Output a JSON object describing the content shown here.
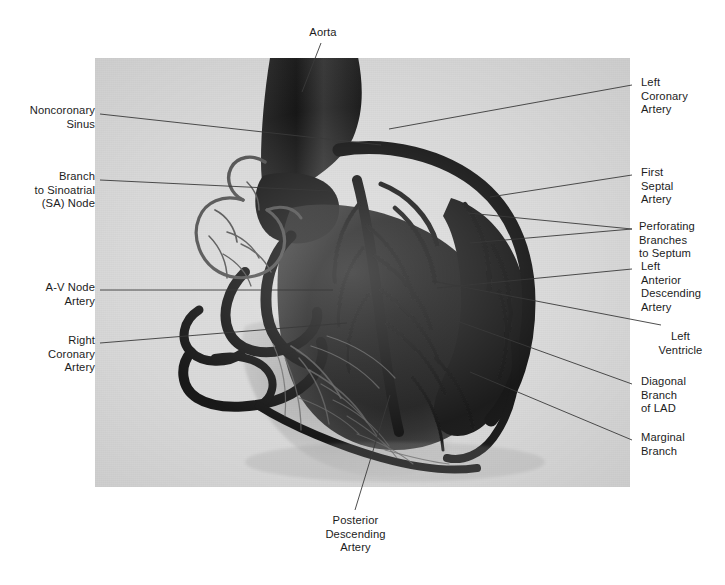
{
  "figure": {
    "kind": "coronary-arterial-cast-photograph",
    "plate": {
      "background_color": "#d8d8d8",
      "cast_color": "#141414",
      "left": 95,
      "top": 58,
      "width": 535,
      "height": 429
    },
    "page_background": "#ffffff",
    "leader_line_color": "#3a3a3a",
    "text_color": "#1c1c1c"
  },
  "labels": {
    "aorta": "Aorta",
    "noncoronary_sinus": "Noncoronary\nSinus",
    "sa_node_branch": "Branch\nto Sinoatrial\n(SA) Node",
    "av_node_artery": "A-V Node\nArtery",
    "right_coronary_artery": "Right\nCoronary\nArtery",
    "posterior_descending_artery": "Posterior\nDescending\nArtery",
    "left_coronary_artery": "Left\nCoronary\nArtery",
    "first_septal_artery": "First\nSeptal\nArtery",
    "perforating_branches": "Perforating\nBranches\nto Septum",
    "left_anterior_descending": "Left\nAnterior\nDescending\nArtery",
    "left_ventricle": "Left\nVentricle",
    "diagonal_branch_lad": "Diagonal\nBranch\nof LAD",
    "marginal_branch": "Marginal\nBranch"
  }
}
